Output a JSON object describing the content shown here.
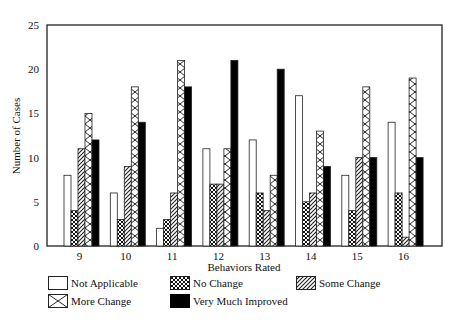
{
  "chart_data": {
    "type": "bar",
    "title": "",
    "xlabel": "Behaviors Rated",
    "ylabel": "Number of Cases",
    "ylim": [
      0,
      25
    ],
    "yticks": [
      0,
      5,
      10,
      15,
      20,
      25
    ],
    "grid": false,
    "legend_position": "bottom",
    "categories": [
      "9",
      "10",
      "11",
      "12",
      "13",
      "14",
      "15",
      "16"
    ],
    "series": [
      {
        "name": "Not Applicable",
        "pattern": "white",
        "values": [
          8,
          6,
          2,
          11,
          12,
          17,
          8,
          14
        ]
      },
      {
        "name": "No Change",
        "pattern": "dense-crosshatch",
        "values": [
          4,
          3,
          3,
          7,
          6,
          5,
          4,
          6
        ]
      },
      {
        "name": "Some Change",
        "pattern": "diagonal-stripes",
        "values": [
          11,
          9,
          6,
          7,
          4,
          6,
          10,
          1
        ]
      },
      {
        "name": "More Change",
        "pattern": "open-crosshatch",
        "values": [
          15,
          18,
          21,
          11,
          8,
          13,
          18,
          19
        ]
      },
      {
        "name": "Very Much Improved",
        "pattern": "solid-black",
        "values": [
          12,
          14,
          18,
          21,
          20,
          9,
          10,
          10
        ]
      }
    ]
  }
}
